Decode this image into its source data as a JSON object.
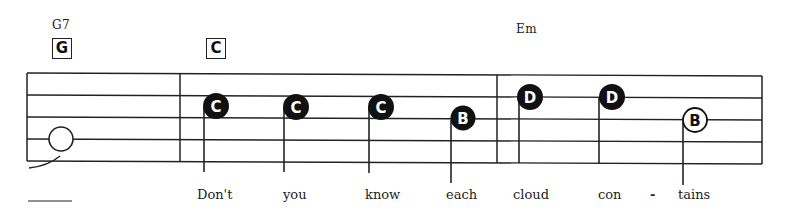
{
  "score": {
    "chords": [
      {
        "name": "G7",
        "x": 52,
        "y": 18
      },
      {
        "name": "Em",
        "x": 516,
        "y": 22
      }
    ],
    "chord_boxes": [
      {
        "label": "G",
        "x": 52,
        "y": 38
      },
      {
        "label": "C",
        "x": 206,
        "y": 38
      }
    ],
    "staff": {
      "left": 27,
      "right": 762,
      "lines_y_left": [
        73,
        95,
        117,
        139,
        161
      ],
      "lines_y_right": [
        76,
        98,
        120,
        142,
        164
      ],
      "barlines_x": [
        27,
        180,
        497,
        762
      ]
    },
    "notes": [
      {
        "letter": "",
        "filled": false,
        "x": 61,
        "y": 139,
        "stem": false
      },
      {
        "letter": "C",
        "filled": true,
        "x": 216,
        "y": 106,
        "stem_x": 204,
        "stem_bottom": 172
      },
      {
        "letter": "C",
        "filled": true,
        "x": 296,
        "y": 107,
        "stem_x": 284,
        "stem_bottom": 172
      },
      {
        "letter": "C",
        "filled": true,
        "x": 381,
        "y": 107,
        "stem_x": 369,
        "stem_bottom": 173
      },
      {
        "letter": "B",
        "filled": true,
        "x": 463,
        "y": 118,
        "stem_x": 451,
        "stem_bottom": 183
      },
      {
        "letter": "D",
        "filled": true,
        "x": 530,
        "y": 97,
        "stem_x": 519,
        "stem_bottom": 163
      },
      {
        "letter": "D",
        "filled": true,
        "x": 612,
        "y": 97,
        "stem_x": 599,
        "stem_bottom": 164
      },
      {
        "letter": "B",
        "filled": false,
        "x": 695,
        "y": 120,
        "stem_x": 683,
        "stem_bottom": 185
      }
    ],
    "lyrics": [
      {
        "text": "Don't",
        "x": 197
      },
      {
        "text": "you",
        "x": 283
      },
      {
        "text": "know",
        "x": 365
      },
      {
        "text": "each",
        "x": 446
      },
      {
        "text": "cloud",
        "x": 513
      },
      {
        "text": "con",
        "x": 598
      },
      {
        "text": "-",
        "x": 650
      },
      {
        "text": "tains",
        "x": 678
      }
    ],
    "colors": {
      "ink": "#111111",
      "paper": "#ffffff"
    }
  }
}
